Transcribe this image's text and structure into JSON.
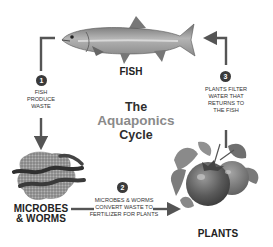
{
  "title": {
    "line1": "The",
    "line2": "Aquaponics",
    "line3": "Cycle"
  },
  "nodes": {
    "fish": {
      "label": "FISH",
      "icon": "fish-icon"
    },
    "microbes": {
      "label_line1": "MICROBES",
      "label_line2": "& WORMS",
      "icon": "worms-icon"
    },
    "plants": {
      "label": "PLANTS",
      "icon": "plants-icon"
    }
  },
  "steps": [
    {
      "number": "1",
      "lines": [
        "FISH",
        "PRODUCE",
        "WASTE"
      ]
    },
    {
      "number": "2",
      "lines": [
        "MICROBES & WORMS",
        "CONVERT WASTE TO",
        "FERTILIZER FOR PLANTS"
      ]
    },
    {
      "number": "3",
      "lines": [
        "PLANTS FILTER",
        "WATER THAT",
        "RETURNS TO",
        "THE FISH"
      ]
    }
  ],
  "colors": {
    "arrow": "#555555",
    "badge": "#3a3a3a",
    "title_dark": "#2e2e2e",
    "title_accent": "#8a8a8a"
  }
}
